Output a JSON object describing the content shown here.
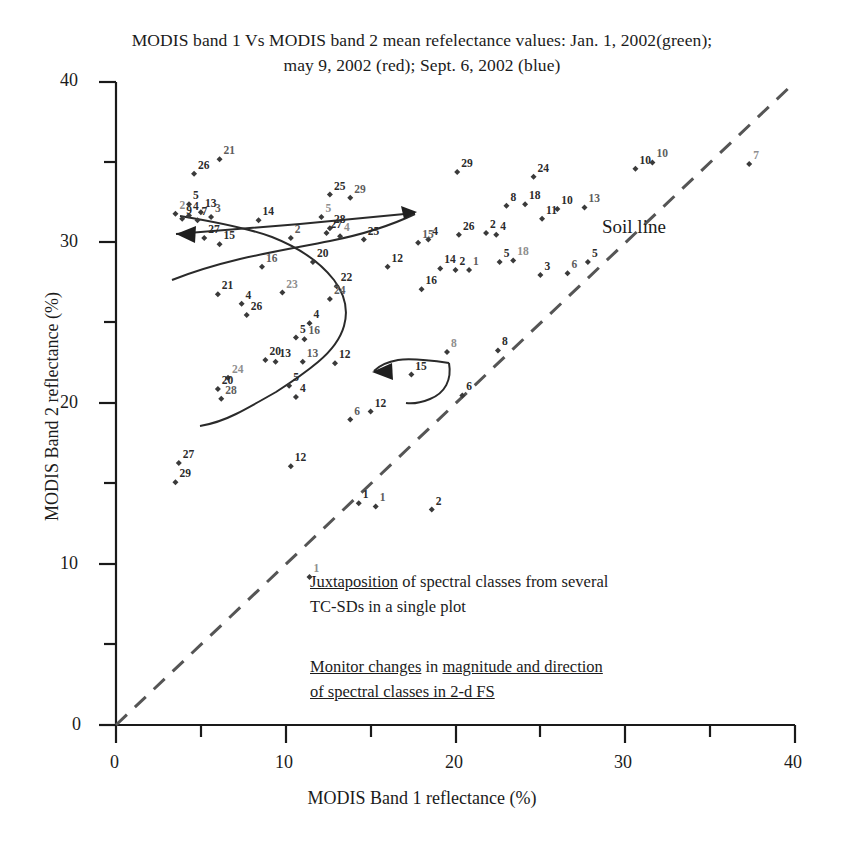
{
  "title": {
    "line1": "MODIS band 1 Vs MODIS band 2 mean refelectance values: Jan. 1, 2002(green);",
    "line2": "may 9, 2002 (red); Sept. 6, 2002 (blue)"
  },
  "annotations": {
    "soil_line": "Soil line",
    "note1_line1_underlined": "Juxtaposition",
    "note1_line1_rest": " of spectral classes from several",
    "note1_line2": "TC-SDs in a single plot",
    "note2_a": "Monitor changes",
    "note2_b": " in ",
    "note2_c": "magnitude and direction",
    "note2_line2": "of spectral classes in 2-d FS"
  },
  "chart_data": {
    "type": "scatter",
    "title": "MODIS band 1 Vs MODIS band 2 mean refelectance values: Jan. 1, 2002(green); may 9, 2002 (red); Sept. 6, 2002 (blue)",
    "xlabel": "MODIS Band 1 reflectance (%)",
    "ylabel": "MODIS Band 2 reflectance (%)",
    "xlim": [
      0,
      40
    ],
    "ylim": [
      0,
      40
    ],
    "xticks": [
      0,
      10,
      20,
      30,
      40
    ],
    "yticks": [
      0,
      10,
      20,
      30,
      40
    ],
    "xminorticks": [
      5,
      15,
      25,
      35
    ],
    "yminorticks": [
      5,
      15,
      25,
      35
    ],
    "grid": false,
    "legend": "none",
    "reference_line": {
      "name": "Soil line",
      "style": "dashed",
      "from": [
        0,
        0
      ],
      "to": [
        40,
        40
      ]
    },
    "points": [
      {
        "x": 6.1,
        "y": 35.2,
        "label": "21"
      },
      {
        "x": 4.6,
        "y": 34.3,
        "label": "26"
      },
      {
        "x": 24.6,
        "y": 34.1,
        "label": "24"
      },
      {
        "x": 20.1,
        "y": 34.4,
        "label": "29"
      },
      {
        "x": 12.6,
        "y": 33.0,
        "label": "25"
      },
      {
        "x": 13.8,
        "y": 32.8,
        "label": "29"
      },
      {
        "x": 4.3,
        "y": 32.4,
        "label": "5"
      },
      {
        "x": 3.5,
        "y": 31.8,
        "label": "2"
      },
      {
        "x": 4.3,
        "y": 31.7,
        "label": "4"
      },
      {
        "x": 5.0,
        "y": 31.9,
        "label": "13"
      },
      {
        "x": 5.6,
        "y": 31.6,
        "label": "3"
      },
      {
        "x": 4.8,
        "y": 31.4,
        "label": "7"
      },
      {
        "x": 3.9,
        "y": 31.5,
        "label": "9"
      },
      {
        "x": 8.4,
        "y": 31.4,
        "label": "14"
      },
      {
        "x": 12.1,
        "y": 31.6,
        "label": "5"
      },
      {
        "x": 27.6,
        "y": 32.2,
        "label": "13"
      },
      {
        "x": 23.0,
        "y": 32.3,
        "label": "8"
      },
      {
        "x": 24.1,
        "y": 32.4,
        "label": "18"
      },
      {
        "x": 26.0,
        "y": 32.1,
        "label": "10"
      },
      {
        "x": 30.6,
        "y": 34.6,
        "label": "10"
      },
      {
        "x": 31.6,
        "y": 35.0,
        "label": "10"
      },
      {
        "x": 37.3,
        "y": 34.9,
        "label": "7"
      },
      {
        "x": 25.1,
        "y": 31.5,
        "label": "11"
      },
      {
        "x": 5.2,
        "y": 30.3,
        "label": "27"
      },
      {
        "x": 6.1,
        "y": 29.9,
        "label": "15"
      },
      {
        "x": 10.3,
        "y": 30.3,
        "label": "2"
      },
      {
        "x": 12.4,
        "y": 30.6,
        "label": "27"
      },
      {
        "x": 12.6,
        "y": 30.9,
        "label": "28"
      },
      {
        "x": 13.2,
        "y": 30.4,
        "label": "4"
      },
      {
        "x": 14.6,
        "y": 30.2,
        "label": "25"
      },
      {
        "x": 17.8,
        "y": 30.0,
        "label": "15"
      },
      {
        "x": 18.4,
        "y": 30.2,
        "label": "4"
      },
      {
        "x": 20.2,
        "y": 30.5,
        "label": "26"
      },
      {
        "x": 21.8,
        "y": 30.6,
        "label": "2"
      },
      {
        "x": 22.4,
        "y": 30.5,
        "label": "4"
      },
      {
        "x": 8.6,
        "y": 28.5,
        "label": "16"
      },
      {
        "x": 11.6,
        "y": 28.8,
        "label": "20"
      },
      {
        "x": 16.0,
        "y": 28.5,
        "label": "12"
      },
      {
        "x": 19.1,
        "y": 28.4,
        "label": "14"
      },
      {
        "x": 20.0,
        "y": 28.3,
        "label": "2"
      },
      {
        "x": 20.8,
        "y": 28.3,
        "label": "1"
      },
      {
        "x": 22.6,
        "y": 28.8,
        "label": "5"
      },
      {
        "x": 23.4,
        "y": 28.9,
        "label": "18"
      },
      {
        "x": 27.8,
        "y": 28.8,
        "label": "5"
      },
      {
        "x": 25.0,
        "y": 28.0,
        "label": "3"
      },
      {
        "x": 26.6,
        "y": 28.1,
        "label": "6"
      },
      {
        "x": 13.0,
        "y": 27.3,
        "label": "22"
      },
      {
        "x": 18.0,
        "y": 27.1,
        "label": "16"
      },
      {
        "x": 6.0,
        "y": 26.8,
        "label": "21"
      },
      {
        "x": 9.8,
        "y": 26.9,
        "label": "23"
      },
      {
        "x": 12.6,
        "y": 26.5,
        "label": "24"
      },
      {
        "x": 7.4,
        "y": 26.2,
        "label": "4"
      },
      {
        "x": 7.7,
        "y": 25.5,
        "label": "26"
      },
      {
        "x": 11.4,
        "y": 25.0,
        "label": "4"
      },
      {
        "x": 10.6,
        "y": 24.1,
        "label": "5"
      },
      {
        "x": 11.1,
        "y": 24.0,
        "label": "16"
      },
      {
        "x": 19.5,
        "y": 23.2,
        "label": "8"
      },
      {
        "x": 22.5,
        "y": 23.3,
        "label": "8"
      },
      {
        "x": 8.8,
        "y": 22.7,
        "label": "20"
      },
      {
        "x": 9.4,
        "y": 22.6,
        "label": "13"
      },
      {
        "x": 11.0,
        "y": 22.6,
        "label": "13"
      },
      {
        "x": 12.9,
        "y": 22.5,
        "label": "12"
      },
      {
        "x": 17.4,
        "y": 21.8,
        "label": "15"
      },
      {
        "x": 6.6,
        "y": 21.6,
        "label": "24"
      },
      {
        "x": 6.0,
        "y": 20.9,
        "label": "20"
      },
      {
        "x": 6.2,
        "y": 20.3,
        "label": "28"
      },
      {
        "x": 10.2,
        "y": 21.1,
        "label": "5"
      },
      {
        "x": 10.6,
        "y": 20.4,
        "label": "4"
      },
      {
        "x": 20.4,
        "y": 20.5,
        "label": "6"
      },
      {
        "x": 15.0,
        "y": 19.5,
        "label": "12"
      },
      {
        "x": 13.8,
        "y": 19.0,
        "label": "6"
      },
      {
        "x": 3.7,
        "y": 16.3,
        "label": "27"
      },
      {
        "x": 10.3,
        "y": 16.1,
        "label": "12"
      },
      {
        "x": 3.5,
        "y": 15.1,
        "label": "29"
      },
      {
        "x": 14.3,
        "y": 13.8,
        "label": "1"
      },
      {
        "x": 15.3,
        "y": 13.6,
        "label": "1"
      },
      {
        "x": 18.6,
        "y": 13.4,
        "label": "2"
      },
      {
        "x": 11.4,
        "y": 9.2,
        "label": "1"
      }
    ],
    "trajectories": [
      {
        "name": "upper-left-curve",
        "arrow": false
      },
      {
        "name": "horizontal-arrow-17",
        "arrow": true,
        "label": "17"
      },
      {
        "name": "lower-arc-arrow-8",
        "arrow": true,
        "label": "8"
      },
      {
        "name": "diagonal-curve-22-24",
        "arrow": false
      }
    ]
  },
  "colors": {
    "axis": "#1a1a1a",
    "point": "#3a3a3a",
    "soil_line": "#555555",
    "trajectory": "#2a2a2a"
  }
}
